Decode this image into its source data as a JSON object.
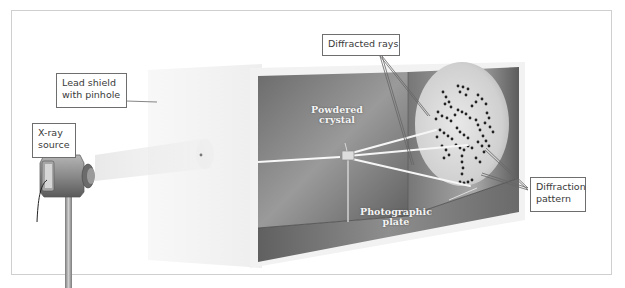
{
  "figure": {
    "colors": {
      "frame_border": "#cfcfcf",
      "callout_border": "#6e6e6e",
      "box_dark": "#5a5a5a",
      "box_mid": "#8a8a8a",
      "plate_light": "#dcdcdc",
      "beam": "#f5f5f5",
      "spot": "#222222"
    },
    "callouts": {
      "lead_shield": "Lead shield\nwith pinhole",
      "lead_shield_line1": "Lead shield",
      "lead_shield_line2": "with pinhole",
      "xray_source_line1": "X-ray",
      "xray_source_line2": "source",
      "diffracted_rays": "Diffracted rays",
      "diffraction_pattern_line1": "Diffraction",
      "diffraction_pattern_line2": "pattern"
    },
    "inline_labels": {
      "powdered_crystal_line1": "Powdered",
      "powdered_crystal_line2": "crystal",
      "photographic_plate_line1": "Photographic",
      "photographic_plate_line2": "plate"
    },
    "components": [
      {
        "name": "X-ray source",
        "icon": "xray-tube-icon"
      },
      {
        "name": "Lead shield with pinhole",
        "icon": "shield-icon"
      },
      {
        "name": "Powdered crystal",
        "icon": "crystal-icon"
      },
      {
        "name": "Photographic plate",
        "icon": "plate-icon"
      },
      {
        "name": "Diffraction pattern",
        "icon": "dot-pattern-icon"
      }
    ]
  }
}
